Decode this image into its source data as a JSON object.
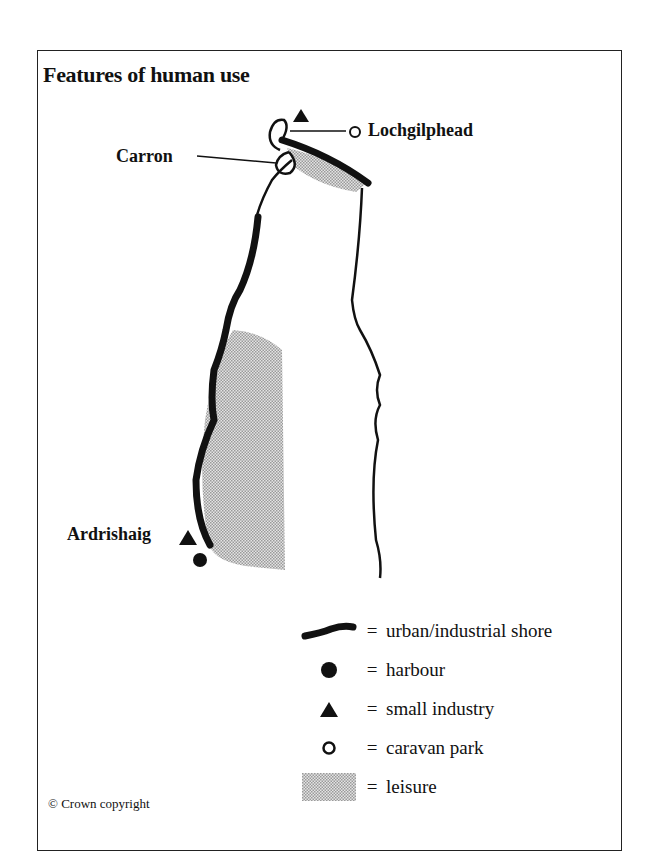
{
  "title": "Features of human use",
  "places": {
    "north_town": "Lochgilphead",
    "inlet": "Carron",
    "south_town": "Ardrishaig"
  },
  "legend": [
    {
      "symbol": "thick-line-icon",
      "eq": "=",
      "label": "urban/industrial shore"
    },
    {
      "symbol": "filled-circle-icon",
      "eq": "=",
      "label": "harbour"
    },
    {
      "symbol": "filled-triangle-icon",
      "eq": "=",
      "label": "small industry"
    },
    {
      "symbol": "open-circle-icon",
      "eq": "=",
      "label": "caravan park"
    },
    {
      "symbol": "stipple-swatch-icon",
      "eq": "=",
      "label": "leisure"
    }
  ],
  "copyright": "© Crown copyright",
  "colors": {
    "ink": "#111111",
    "leisure": "#c8c8c8",
    "frame": "#222222"
  }
}
